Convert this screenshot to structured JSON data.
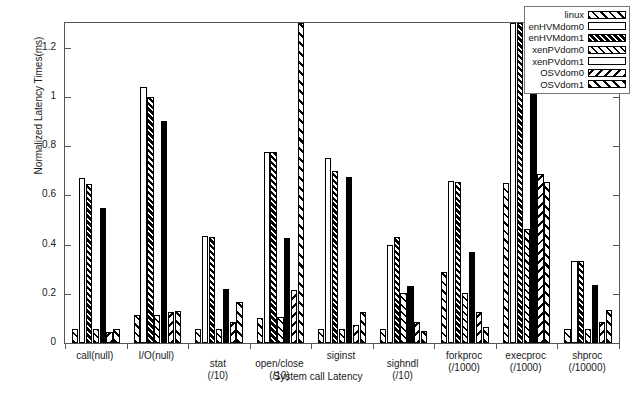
{
  "chart_data": {
    "type": "bar",
    "title": "",
    "xlabel": "System call Latency",
    "ylabel": "Normalized Latency Times(ms)",
    "ylim": [
      0,
      1.3
    ],
    "yticks": [
      0,
      0.2,
      0.4,
      0.6,
      0.8,
      1,
      1.2
    ],
    "ytick_labels": [
      "0",
      "0.2",
      "0.4",
      "0.6",
      "0.8",
      "1",
      "1.2"
    ],
    "grid": false,
    "legend_position": "top-right",
    "categories": [
      "call(null)",
      "I/O(null)",
      "stat",
      "open/close",
      "siginst",
      "sighndl",
      "forkproc",
      "execproc",
      "shproc"
    ],
    "category_sublabels": [
      "",
      "",
      "(/10)",
      "(/10)",
      "",
      "(/10)",
      "(/1000)",
      "(/1000)",
      "(/10000)"
    ],
    "series": [
      {
        "name": "linux",
        "pattern": "p-linux",
        "values": [
          0.055,
          0.115,
          0.055,
          0.1,
          0.055,
          0.055,
          0.29,
          0.65,
          0.055
        ]
      },
      {
        "name": "enHVMdom0",
        "pattern": "p-hvm0",
        "values": [
          0.67,
          1.04,
          0.435,
          0.775,
          0.75,
          0.4,
          0.66,
          1.3,
          0.335
        ]
      },
      {
        "name": "enHVMdom1",
        "pattern": "p-hvm1",
        "values": [
          0.645,
          1.0,
          0.43,
          0.775,
          0.7,
          0.43,
          0.655,
          1.3,
          0.335
        ]
      },
      {
        "name": "xenPVdom0",
        "pattern": "p-pv0",
        "values": [
          0.055,
          0.115,
          0.055,
          0.105,
          0.055,
          0.205,
          0.205,
          0.465,
          0.055
        ]
      },
      {
        "name": "xenPVdom1",
        "pattern": "p-pv1",
        "values": [
          0.55,
          0.9,
          0.22,
          0.425,
          0.675,
          0.23,
          0.37,
          1.05,
          0.235
        ]
      },
      {
        "name": "OSVdom0",
        "pattern": "p-osv0",
        "values": [
          0.045,
          0.125,
          0.085,
          0.215,
          0.075,
          0.085,
          0.125,
          0.685,
          0.085
        ]
      },
      {
        "name": "OSVdom1",
        "pattern": "p-osv1",
        "values": [
          0.055,
          0.13,
          0.165,
          1.3,
          0.125,
          0.05,
          0.065,
          0.655,
          0.135
        ]
      }
    ]
  },
  "legend": {
    "items": [
      {
        "label": "linux"
      },
      {
        "label": "enHVMdom0"
      },
      {
        "label": "enHVMdom1"
      },
      {
        "label": "xenPVdom0"
      },
      {
        "label": "xenPVdom1"
      },
      {
        "label": "OSVdom0"
      },
      {
        "label": "OSVdom1"
      }
    ]
  }
}
